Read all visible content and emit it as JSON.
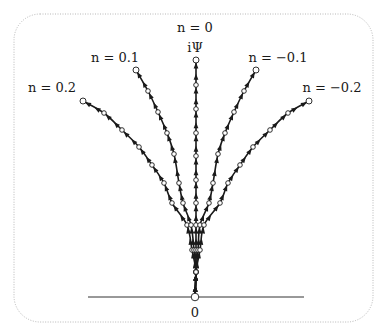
{
  "diagram": {
    "type": "flow-lines",
    "origin_label": "0",
    "top_label": "iΨ",
    "curves": [
      {
        "label": "n = 0.2",
        "param": 0.2,
        "points": [
          [
            195,
            297
          ],
          [
            196,
            272
          ],
          [
            192,
            250
          ],
          [
            187,
            225
          ],
          [
            172,
            203
          ],
          [
            164,
            183
          ],
          [
            152,
            165
          ],
          [
            139,
            147
          ],
          [
            122,
            130
          ],
          [
            104,
            113
          ],
          [
            83,
            101
          ]
        ]
      },
      {
        "label": "n = 0.1",
        "param": 0.1,
        "points": [
          [
            195,
            297
          ],
          [
            196,
            272
          ],
          [
            194,
            250
          ],
          [
            191,
            225
          ],
          [
            183,
            203
          ],
          [
            179,
            183
          ],
          [
            174,
            154
          ],
          [
            167,
            133
          ],
          [
            158,
            112
          ],
          [
            148,
            91
          ],
          [
            136,
            70
          ]
        ]
      },
      {
        "label": "n = 0",
        "param": 0,
        "points": [
          [
            195,
            297
          ],
          [
            196,
            272
          ],
          [
            196,
            250
          ],
          [
            196,
            225
          ],
          [
            196,
            203
          ],
          [
            196,
            180
          ],
          [
            196,
            156
          ],
          [
            196,
            133
          ],
          [
            196,
            109
          ],
          [
            196,
            85
          ],
          [
            196,
            60
          ]
        ]
      },
      {
        "label": "n = −0.1",
        "param": -0.1,
        "points": [
          [
            195,
            297
          ],
          [
            196,
            272
          ],
          [
            198,
            250
          ],
          [
            200,
            225
          ],
          [
            209,
            203
          ],
          [
            213,
            183
          ],
          [
            218,
            154
          ],
          [
            225,
            133
          ],
          [
            234,
            112
          ],
          [
            244,
            91
          ],
          [
            256,
            70
          ]
        ]
      },
      {
        "label": "n = −0.2",
        "param": -0.2,
        "points": [
          [
            195,
            297
          ],
          [
            196,
            272
          ],
          [
            200,
            250
          ],
          [
            204,
            225
          ],
          [
            220,
            203
          ],
          [
            228,
            183
          ],
          [
            240,
            165
          ],
          [
            253,
            147
          ],
          [
            270,
            130
          ],
          [
            288,
            113
          ],
          [
            309,
            101
          ]
        ]
      }
    ],
    "label_positions": [
      {
        "text": "n = 0.2",
        "x": 52,
        "y": 92
      },
      {
        "text": "n = 0.1",
        "x": 115,
        "y": 62
      },
      {
        "text": "n = 0",
        "x": 195,
        "y": 32
      },
      {
        "text": "n = −0.1",
        "x": 278,
        "y": 62
      },
      {
        "text": "n = −0.2",
        "x": 332,
        "y": 92
      }
    ],
    "colors": {
      "line": "#1a1a1a",
      "node_fill": "#ffffff",
      "frame": "#b8b8b8"
    }
  }
}
